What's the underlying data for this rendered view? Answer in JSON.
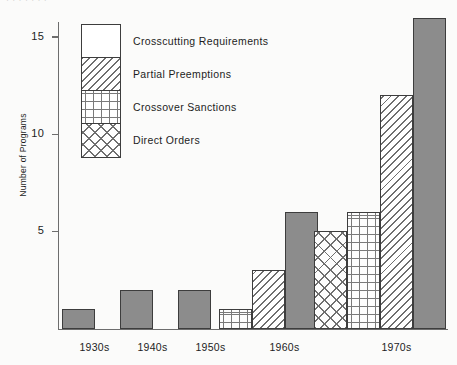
{
  "figure": {
    "partial_title_top": "· ·   · · ·      · ·",
    "background_color": "#fbfbfa",
    "axis_color": "#6d6d6d",
    "bar_outline_color": "#3d3d3d",
    "solid_fill_color": "#8c8c8c"
  },
  "chart_data": {
    "type": "bar",
    "title": "",
    "xlabel": "",
    "ylabel": "Number of Programs",
    "categories": [
      "1930s",
      "1940s",
      "1950s",
      "1960s",
      "1970s"
    ],
    "ylim": [
      0,
      17
    ],
    "yticks": [
      5,
      10,
      15
    ],
    "ytick_labels": [
      "5",
      "10",
      "15"
    ],
    "grid": false,
    "legend_position": "upper-left-inside",
    "series": [
      {
        "name": "Crosscutting Requirements",
        "pattern": "solid-gray",
        "values": [
          1,
          2,
          2,
          6,
          16
        ]
      },
      {
        "name": "Partial Preemptions",
        "pattern": "diagonal-hatch",
        "values": [
          0,
          0,
          0,
          3,
          12
        ]
      },
      {
        "name": "Crossover Sanctions",
        "pattern": "plus-grid",
        "values": [
          0,
          0,
          0,
          1,
          6
        ]
      },
      {
        "name": "Direct Orders",
        "pattern": "diamond-lattice",
        "values": [
          0,
          0,
          0,
          0,
          5
        ]
      }
    ],
    "bars": [
      {
        "category": "1930s",
        "series": "Crosscutting Requirements",
        "value": 1,
        "pattern": "solid-gray",
        "x": 4,
        "w": 33
      },
      {
        "category": "1940s",
        "series": "Crosscutting Requirements",
        "value": 2,
        "pattern": "solid-gray",
        "x": 62,
        "w": 33
      },
      {
        "category": "1950s",
        "series": "Crosscutting Requirements",
        "value": 2,
        "pattern": "solid-gray",
        "x": 120,
        "w": 33
      },
      {
        "category": "1960s",
        "series": "Crossover Sanctions",
        "value": 1,
        "pattern": "plus-grid",
        "x": 161,
        "w": 33
      },
      {
        "category": "1960s",
        "series": "Partial Preemptions",
        "value": 3,
        "pattern": "diagonal-hatch",
        "x": 194,
        "w": 33
      },
      {
        "category": "1960s",
        "series": "Crosscutting Requirements",
        "value": 6,
        "pattern": "solid-gray",
        "x": 227,
        "w": 33
      },
      {
        "category": "1970s",
        "series": "Direct Orders",
        "value": 5,
        "pattern": "diamond-lattice",
        "x": 256,
        "w": 33
      },
      {
        "category": "1970s",
        "series": "Crossover Sanctions",
        "value": 6,
        "pattern": "plus-grid",
        "x": 289,
        "w": 33
      },
      {
        "category": "1970s",
        "series": "Partial Preemptions",
        "value": 12,
        "pattern": "diagonal-hatch",
        "x": 322,
        "w": 33
      },
      {
        "category": "1970s",
        "series": "Crosscutting Requirements",
        "value": 16,
        "pattern": "solid-gray",
        "x": 355,
        "w": 33
      }
    ],
    "category_label_x": [
      20,
      78,
      136,
      210,
      322
    ]
  },
  "legend": {
    "items": [
      {
        "label": "Crosscutting Requirements",
        "pattern": "solid-gray"
      },
      {
        "label": "Partial Preemptions",
        "pattern": "diagonal-hatch"
      },
      {
        "label": "Crossover Sanctions",
        "pattern": "plus-grid"
      },
      {
        "label": "Direct Orders",
        "pattern": "diamond-lattice"
      }
    ]
  }
}
